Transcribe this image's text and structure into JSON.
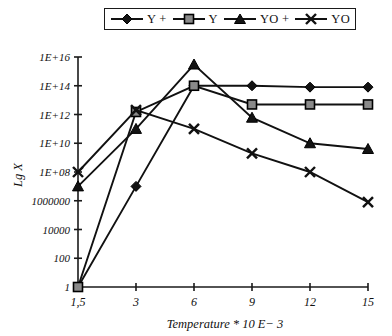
{
  "legend": {
    "entries": [
      {
        "label": "Y +",
        "marker": "diamond-marker-icon"
      },
      {
        "label": "Y",
        "marker": "square-marker-icon"
      },
      {
        "label": "YO +",
        "marker": "triangle-marker-icon"
      },
      {
        "label": "YO",
        "marker": "x-marker-icon"
      }
    ]
  },
  "chart_data": {
    "type": "line",
    "title": "",
    "xlabel": "Temperature * 10 E− 3",
    "ylabel": "Lg X",
    "x": [
      1.5,
      3,
      6,
      9,
      12,
      15
    ],
    "xtick_labels": [
      "1,5",
      "3",
      "6",
      "9",
      "12",
      "15"
    ],
    "ytick_labels": [
      "1E+16",
      "1E+14",
      "1E+12",
      "1E+10",
      "1E+08",
      "1000000",
      "10000",
      "100",
      "1"
    ],
    "ytick_values": [
      1e+16,
      100000000000000.0,
      1000000000000.0,
      10000000000.0,
      100000000.0,
      1000000,
      10000,
      100,
      1
    ],
    "yscale": "log",
    "ylim": [
      1,
      1e+16
    ],
    "grid": false,
    "legend_position": "top",
    "series": [
      {
        "name": "Y +",
        "marker": "diamond",
        "values": [
          1,
          10000000.0,
          100000000000000.0,
          100000000000000.0,
          80000000000000.0,
          80000000000000.0
        ]
      },
      {
        "name": "Y",
        "marker": "square",
        "values": [
          1,
          1500000000000.0,
          100000000000000.0,
          5000000000000.0,
          5000000000000.0,
          5000000000000.0
        ]
      },
      {
        "name": "YO +",
        "marker": "triangle",
        "values": [
          10000000.0,
          100000000000.0,
          3000000000000000.0,
          600000000000.0,
          10000000000.0,
          4000000000.0
        ]
      },
      {
        "name": "YO",
        "marker": "x",
        "values": [
          100000000.0,
          2000000000000.0,
          100000000000.0,
          2000000000.0,
          100000000.0,
          800000.0
        ]
      }
    ]
  },
  "colors": {
    "line": "#111111",
    "marker_dark": "#131313",
    "marker_grey": "#8a8a8a",
    "axis": "#1a1a1a",
    "background": "#ffffff"
  }
}
